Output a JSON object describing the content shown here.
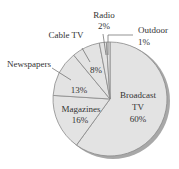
{
  "chart_data": {
    "type": "pie",
    "title": "",
    "categories": [
      "Broadcast TV",
      "Magazines",
      "Newspapers",
      "Cable TV",
      "Radio",
      "Outdoor"
    ],
    "values": [
      60,
      16,
      13,
      8,
      2,
      1
    ],
    "unit": "%",
    "labels": [
      {
        "name": "Broadcast TV",
        "line1": "Broadcast",
        "line2": "TV",
        "pct": "60%"
      },
      {
        "name": "Magazines",
        "line1": "Magazines",
        "pct": "16%"
      },
      {
        "name": "Newspapers",
        "line1": "Newspapers",
        "pct": "13%"
      },
      {
        "name": "Cable TV",
        "line1": "Cable TV",
        "pct": "8%"
      },
      {
        "name": "Radio",
        "line1": "Radio",
        "pct": "2%"
      },
      {
        "name": "Outdoor",
        "line1": "Outdoor",
        "pct": "1%"
      }
    ],
    "colors": {
      "fill": "#e3e3e3",
      "edge": "#8a8a8a",
      "shadow": "#9a9a9a"
    }
  }
}
